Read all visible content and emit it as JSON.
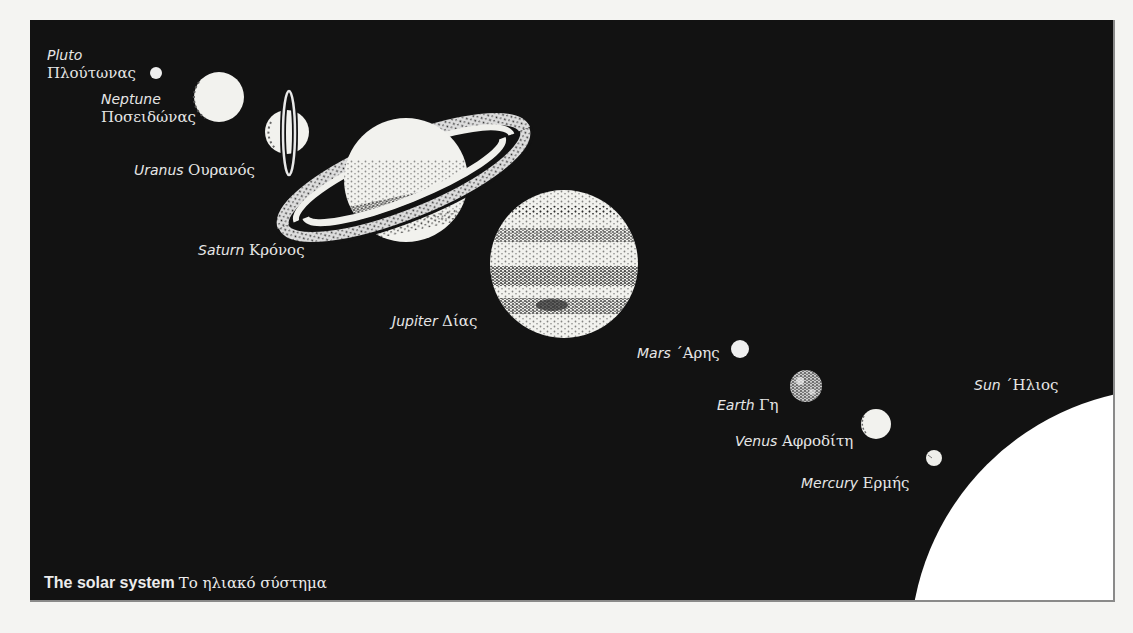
{
  "figure": {
    "caption_en": "The solar system",
    "caption_gr": "Το ηλιακό σύστημα",
    "colors": {
      "page_background": "#f4f4f2",
      "frame_background": "#121212",
      "planet_fill": "#f2f2ee",
      "stipple": "#2a2a2a",
      "label_text": "#e6e6e6"
    }
  },
  "bodies": [
    {
      "id": "pluto",
      "name_en": "Pluto",
      "name_gr": "Πλούτωνας"
    },
    {
      "id": "neptune",
      "name_en": "Neptune",
      "name_gr": "Ποσειδώνας"
    },
    {
      "id": "uranus",
      "name_en": "Uranus",
      "name_gr": "Ουρανός"
    },
    {
      "id": "saturn",
      "name_en": "Saturn",
      "name_gr": "Κρόνος"
    },
    {
      "id": "jupiter",
      "name_en": "Jupiter",
      "name_gr": "Δίας"
    },
    {
      "id": "mars",
      "name_en": "Mars",
      "name_gr": "΄Αρης"
    },
    {
      "id": "earth",
      "name_en": "Earth",
      "name_gr": "Γη"
    },
    {
      "id": "venus",
      "name_en": "Venus",
      "name_gr": "Αφροδίτη"
    },
    {
      "id": "mercury",
      "name_en": "Mercury",
      "name_gr": "Ερμής"
    },
    {
      "id": "sun",
      "name_en": "Sun",
      "name_gr": "΄Ηλιος"
    }
  ]
}
